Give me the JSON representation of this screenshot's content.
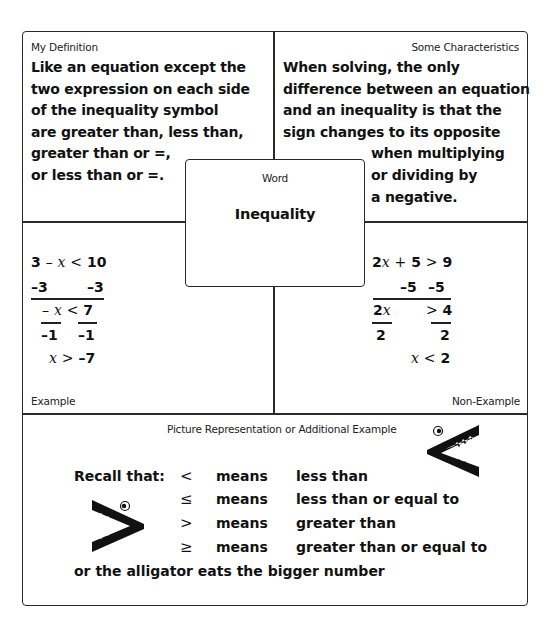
{
  "definition": {
    "label": "My Definition",
    "lines": [
      "Like an equation except the",
      "two expression on each side",
      "of the inequality symbol",
      "are greater than, less than,",
      "greater than or =,",
      "or less than or =."
    ]
  },
  "characteristics": {
    "label": "Some Characteristics",
    "lines": [
      "When solving, the only",
      "difference between an equation",
      "and an inequality is that the",
      "sign changes to its opposite",
      "when multiplying",
      "or dividing by",
      "a negative."
    ]
  },
  "word": {
    "label": "Word",
    "term": "Inequality"
  },
  "example": {
    "label": "Example",
    "steps": {
      "line1": {
        "a": "3",
        "op": "–",
        "var": "x",
        "rel": "<",
        "b": "10"
      },
      "line2": {
        "left": "–3",
        "right": "–3"
      },
      "line3": {
        "op": "–",
        "var": "x",
        "rel": "<",
        "b": "7"
      },
      "line4": {
        "left": "–1",
        "right": "–1"
      },
      "line5": {
        "var": "x",
        "rel": ">",
        "b": "–7"
      }
    }
  },
  "non_example": {
    "label": "Non-Example",
    "steps": {
      "line1": {
        "coef": "2",
        "var": "x",
        "op": "+",
        "a": "5",
        "rel": ">",
        "b": "9"
      },
      "line2": {
        "left": "–5",
        "right": "–5"
      },
      "line3": {
        "coef": "2",
        "var": "x",
        "rel": ">",
        "b": "4"
      },
      "line4": {
        "left": "2",
        "right": "2"
      },
      "line5": {
        "var": "x",
        "rel": "<",
        "b": "2"
      }
    }
  },
  "picture": {
    "label": "Picture Representation or Additional Example",
    "recall_label": "Recall that:",
    "rows": [
      {
        "symbol": "<",
        "means": "means",
        "meaning": "less than"
      },
      {
        "symbol": "≤",
        "means": "means",
        "meaning": "less than or equal to"
      },
      {
        "symbol": ">",
        "means": "means",
        "meaning": "greater than"
      },
      {
        "symbol": "≥",
        "means": "means",
        "meaning": "greater than or equal to"
      }
    ],
    "footer": "or the alligator eats the bigger number"
  },
  "icons": {
    "alligator_left": "alligator-less-than-icon",
    "alligator_right": "alligator-greater-than-icon"
  }
}
